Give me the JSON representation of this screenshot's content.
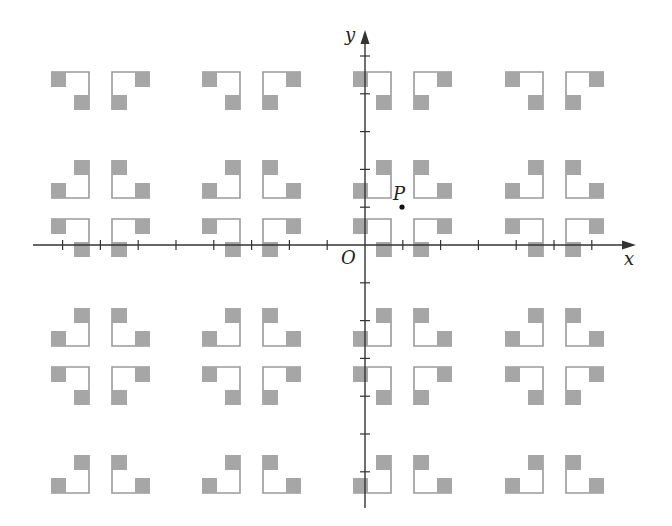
{
  "diagram": {
    "type": "coordinate-plane-tiling",
    "axes": {
      "x_label": "x",
      "y_label": "y",
      "origin_label": "O",
      "origin_px": [
        365,
        245
      ],
      "tick_spacing_px": 37.8,
      "x_range_px": [
        33,
        636
      ],
      "y_range_px": [
        30,
        508
      ]
    },
    "point": {
      "label": "P",
      "px": [
        402,
        207
      ]
    },
    "colors": {
      "axis": "#333333",
      "frame": "#9a9a9a",
      "fill": "#a6a6a6",
      "point": "#111111",
      "background": "#ffffff"
    },
    "motif": {
      "size_px": 38,
      "square_px": 15,
      "columns_left_px": [
        51,
        112,
        202,
        263,
        353,
        414,
        505,
        566
      ],
      "rows_top_px": [
        72,
        160,
        219,
        308,
        367,
        455
      ],
      "row_orientation": [
        "top",
        "bottom",
        "top",
        "bottom",
        "top",
        "bottom"
      ]
    }
  }
}
